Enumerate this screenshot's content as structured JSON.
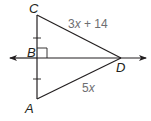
{
  "diagram": {
    "type": "geometry-figure",
    "vertices": {
      "A": {
        "label": "A"
      },
      "B": {
        "label": "B"
      },
      "C": {
        "label": "C"
      },
      "D": {
        "label": "D"
      }
    },
    "segments": {
      "CD": {
        "expression_coeff": "3",
        "expression_var": "x",
        "expression_rest": " + 14"
      },
      "AD": {
        "expression_coeff": "5",
        "expression_var": "x"
      }
    },
    "marks": {
      "right_angle_at": "B",
      "congruent_tick_segments": [
        "CB",
        "BA"
      ]
    },
    "line": {
      "through": [
        "B",
        "D"
      ],
      "arrows": "both"
    },
    "colors": {
      "stroke": "#231f20",
      "expression_text": "#6d6e71",
      "background": "#ffffff"
    }
  }
}
